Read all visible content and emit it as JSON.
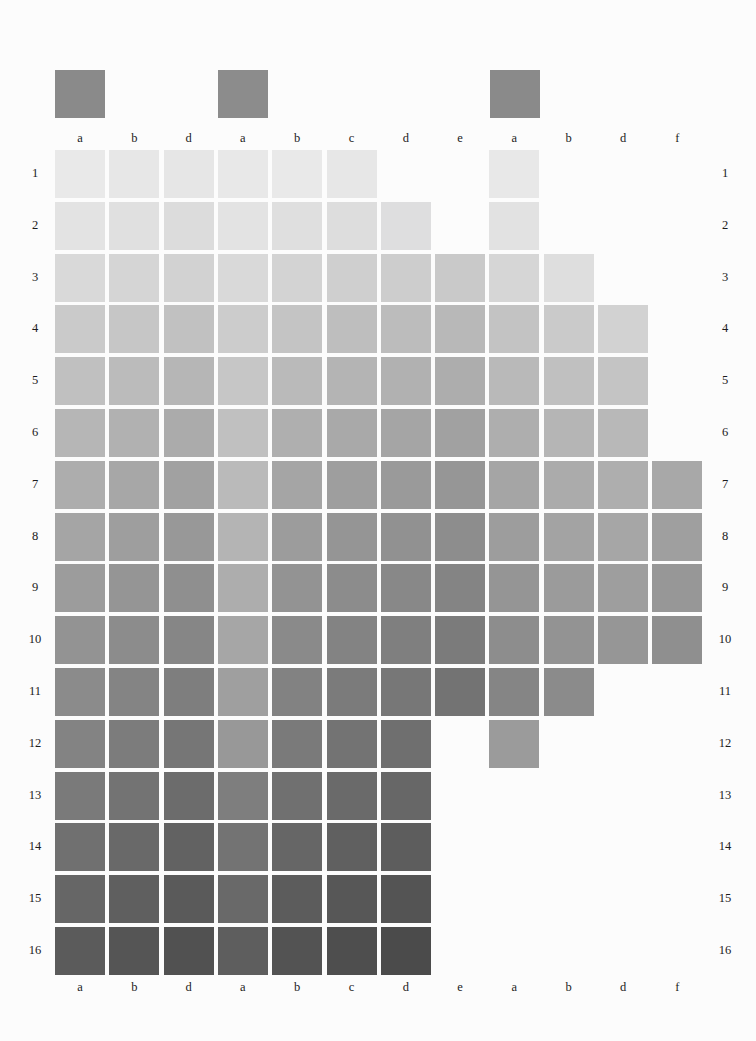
{
  "page": {
    "background": "#fcfcfc",
    "kind": "grayscale-value-reference-chart"
  },
  "sections": [
    {
      "key": "OF",
      "label": "OF",
      "swatch_color": "#8a8a8a",
      "x": 55
    },
    {
      "key": "FO",
      "label": "FO",
      "swatch_color": "#8c8c8c",
      "x": 218
    },
    {
      "key": "O",
      "label": "O",
      "swatch_color": "#8a8a8a",
      "x": 490
    }
  ],
  "column_labels_top": [
    "a",
    "b",
    "d",
    "a",
    "b",
    "c",
    "d",
    "e",
    "a",
    "b",
    "d",
    "f"
  ],
  "column_labels_bottom": [
    "a",
    "b",
    "d",
    "a",
    "b",
    "c",
    "d",
    "e",
    "a",
    "b",
    "d",
    "f"
  ],
  "row_labels_left": [
    "1",
    "2",
    "3",
    "4",
    "5",
    "6",
    "7",
    "8",
    "9",
    "10",
    "11",
    "12",
    "13",
    "14",
    "15",
    "16"
  ],
  "row_labels_right": [
    "1",
    "2",
    "3",
    "4",
    "5",
    "6",
    "7",
    "8",
    "9",
    "10",
    "11",
    "12",
    "13",
    "14",
    "15",
    "16"
  ],
  "chart_data": {
    "type": "heatmap",
    "title": "",
    "xlabel": "",
    "ylabel": "",
    "grid": false,
    "legend": "none",
    "columns": [
      "a",
      "b",
      "d",
      "a",
      "b",
      "c",
      "d",
      "e",
      "a",
      "b",
      "d",
      "f"
    ],
    "column_sections": [
      "OF",
      "OF",
      "OF",
      "FO",
      "FO",
      "FO",
      "FO",
      "FO",
      "O",
      "O",
      "O",
      "O"
    ],
    "rows": [
      "1",
      "2",
      "3",
      "4",
      "5",
      "6",
      "7",
      "8",
      "9",
      "10",
      "11",
      "12",
      "13",
      "14",
      "15",
      "16"
    ],
    "colorscale": "grayscale, light (row 1) to dark (row 16)",
    "note": "null = no swatch printed at that cell",
    "values": [
      [
        "#e9e9e9",
        "#e7e7e7",
        "#e6e6e6",
        "#e8e8e8",
        "#e9e9e9",
        "#e7e7e7",
        null,
        null,
        "#e8e8e8",
        null,
        null,
        null
      ],
      [
        "#e3e3e3",
        "#e0e0e0",
        "#dcdcdc",
        "#e3e3e3",
        "#dfdfdf",
        "#dddddd",
        "#dededf",
        null,
        "#e2e2e2",
        null,
        null,
        null
      ],
      [
        "#d9d9d9",
        "#d5d5d5",
        "#d2d2d2",
        "#d9d9d9",
        "#d3d3d3",
        "#cfcfcf",
        "#cdcdcd",
        "#c9c9c9",
        "#d6d6d6",
        "#dedede",
        null,
        null
      ],
      [
        "#cacaca",
        "#c6c6c6",
        "#c1c1c1",
        "#cccccc",
        "#c4c4c4",
        "#bebebe",
        "#bcbcbc",
        "#b8b8b8",
        "#c3c3c3",
        "#cacaca",
        "#d2d2d2",
        null
      ],
      [
        "#c0c0c0",
        "#bbbbbb",
        "#b6b6b6",
        "#c6c6c6",
        "#bababa",
        "#b4b4b4",
        "#b1b1b1",
        "#adadad",
        "#b9b9b9",
        "#c0c0c0",
        "#c4c4c4",
        null
      ],
      [
        "#b6b6b6",
        "#b1b1b1",
        "#ababab",
        "#c0c0c0",
        "#afafaf",
        "#a9a9a9",
        "#a5a5a5",
        "#a1a1a1",
        "#aeaeae",
        "#b5b5b5",
        "#b8b8b8",
        null
      ],
      [
        "#adadad",
        "#a7a7a7",
        "#a1a1a1",
        "#bababa",
        "#a5a5a5",
        "#9e9e9e",
        "#9a9a9a",
        "#969696",
        "#a5a5a5",
        "#ababab",
        "#aeaeae",
        "#a8a8a8"
      ],
      [
        "#a5a5a5",
        "#9e9e9e",
        "#989898",
        "#b4b4b4",
        "#9c9c9c",
        "#959595",
        "#919191",
        "#8d8d8d",
        "#9d9d9d",
        "#a3a3a3",
        "#a6a6a6",
        "#9f9f9f"
      ],
      [
        "#9c9c9c",
        "#959595",
        "#8f8f8f",
        "#adadad",
        "#939393",
        "#8c8c8c",
        "#888888",
        "#848484",
        "#959595",
        "#9b9b9b",
        "#9e9e9e",
        "#979797"
      ],
      [
        "#939393",
        "#8c8c8c",
        "#868686",
        "#a6a6a6",
        "#8a8a8a",
        "#838383",
        "#7f7f7f",
        "#7b7b7b",
        "#8d8d8d",
        "#939393",
        "#969696",
        "#8f8f8f"
      ],
      [
        "#8b8b8b",
        "#848484",
        "#7e7e7e",
        "#9f9f9f",
        "#828282",
        "#7b7b7b",
        "#777777",
        "#737373",
        "#858585",
        "#8b8b8b",
        null,
        null
      ],
      [
        "#838383",
        "#7c7c7c",
        "#767676",
        "#989898",
        "#7a7a7a",
        "#737373",
        "#6f6f6f",
        null,
        "#9b9b9b",
        null,
        null,
        null
      ],
      [
        "#7a7a7a",
        "#737373",
        "#6c6c6c",
        "#7e7e7e",
        "#707070",
        "#6a6a6a",
        "#676767",
        null,
        null,
        null,
        null,
        null
      ],
      [
        "#707070",
        "#696969",
        "#626262",
        "#737373",
        "#666666",
        "#606060",
        "#5d5d5d",
        null,
        null,
        null,
        null,
        null
      ],
      [
        "#666666",
        "#5f5f5f",
        "#5a5a5a",
        "#696969",
        "#5c5c5c",
        "#575757",
        "#545454",
        null,
        null,
        null,
        null,
        null
      ],
      [
        "#5b5b5b",
        "#555555",
        "#515151",
        "#5e5e5e",
        "#535353",
        "#4e4e4e",
        "#4b4b4b",
        null,
        null,
        null,
        null,
        null
      ]
    ]
  },
  "layout": {
    "grid_origin_x": 55,
    "grid_origin_y": 150,
    "cell_w": 50,
    "cell_h": 48,
    "col_step": 54.3,
    "row_step": 51.8,
    "header_swatch_y": 70,
    "header_label_y": 48,
    "col_label_top_y": 131,
    "col_label_bottom_y": 980,
    "row_label_left_x": 22,
    "row_label_right_x": 712
  }
}
